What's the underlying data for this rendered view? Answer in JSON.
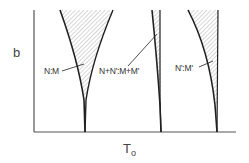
{
  "figure": {
    "y_axis_label": "b",
    "x_axis_label_main": "T",
    "x_axis_label_sub": "o",
    "regions": [
      {
        "label": "N:M",
        "description": "hatched wedge, two-phase coexistence region"
      },
      {
        "label": "N+N':M+M'",
        "description": "narrow hatched wedge"
      },
      {
        "label": "N':M'",
        "description": "hatched wedge"
      }
    ],
    "colors": {
      "line": "#222222",
      "axis": "#555555",
      "hatch": "#888888",
      "background": "#ffffff"
    }
  }
}
